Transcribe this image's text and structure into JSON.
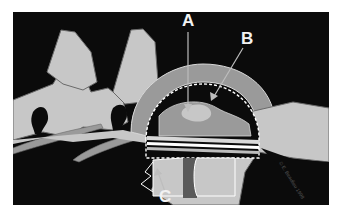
{
  "figure": {
    "type": "anatomical-illustration",
    "labels": [
      {
        "id": "A",
        "text": "A"
      },
      {
        "id": "B",
        "text": "B"
      },
      {
        "id": "C",
        "text": "C"
      }
    ],
    "copyright": "© E. Beaulieu 1998",
    "colors": {
      "background": "#0b0b0b",
      "bone": "#c7c7c7",
      "outline": "#6a6a6a",
      "tissue_mid": "#9a9a9a",
      "label": "#f2f2f2"
    }
  }
}
